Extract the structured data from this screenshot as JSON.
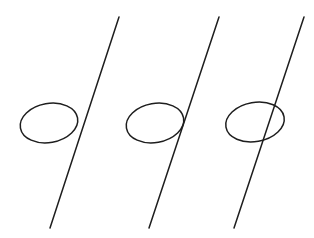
{
  "diagram": {
    "background": "#ffffff",
    "stroke_color": "#1e1e1e",
    "stroke_width": 1.5,
    "panels": [
      {
        "id": "no-intersection",
        "line": {
          "x1": 119,
          "y1": 17,
          "x2": 50,
          "y2": 228
        },
        "ellipse": {
          "cx": 49,
          "cy": 123,
          "rx": 29,
          "ry": 19.5,
          "rotate": -10
        }
      },
      {
        "id": "tangent",
        "line": {
          "x1": 219,
          "y1": 17,
          "x2": 149,
          "y2": 228
        },
        "ellipse": {
          "cx": 155,
          "cy": 123,
          "rx": 29,
          "ry": 19.5,
          "rotate": -10
        }
      },
      {
        "id": "two-intersections",
        "line": {
          "x1": 304,
          "y1": 17,
          "x2": 234,
          "y2": 228
        },
        "ellipse": {
          "cx": 255,
          "cy": 122,
          "rx": 29.5,
          "ry": 19.5,
          "rotate": -10
        }
      }
    ]
  }
}
